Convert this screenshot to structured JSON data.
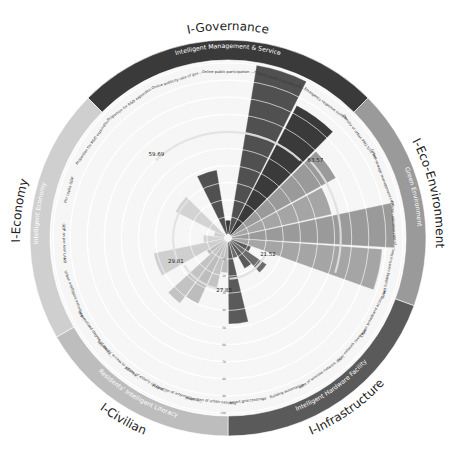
{
  "chart_data": {
    "type": "polar-bar",
    "title": "",
    "radial_axis": {
      "min": 0,
      "max": 100,
      "ticks": [
        0,
        10,
        20,
        30,
        40,
        50,
        60,
        70,
        80,
        90,
        100
      ],
      "grid": true
    },
    "dimensions": [
      {
        "name": "I-Governance",
        "subtitle": "Intelligent Management & Service",
        "color": "#3a3a3a",
        "start_deg": -45,
        "end_deg": 45,
        "average": 59.69,
        "indicators": [
          {
            "label": "Proportion for R&D expenditure of GDP",
            "value": 0
          },
          {
            "label": "Online publicity rate of government non-secret documents",
            "value": 38
          },
          {
            "label": "Online public participation ratio",
            "value": 8
          },
          {
            "label": "Citizen health E-record unification ratio",
            "value": 100
          },
          {
            "label": "Emergency response system",
            "value": 85
          }
        ]
      },
      {
        "name": "I-Eco-Environment",
        "subtitle": "Green Environment",
        "color": "#9a9a9a",
        "start_deg": 45,
        "end_deg": 110,
        "average": 63.57,
        "indicators": [
          {
            "label": "Density of urban PM2.5/10 monitoring points",
            "value": 70
          },
          {
            "label": "Urban sewage management coverage",
            "value": 60
          },
          {
            "label": "Citizen utilization rate of Smart Transportation",
            "value": 95
          },
          {
            "label": "Green building construction rate",
            "value": 88
          }
        ]
      },
      {
        "name": "I-Infrastructure",
        "subtitle": "Intelligent Hardware Facility",
        "color": "#5a5a5a",
        "start_deg": 110,
        "end_deg": 180,
        "average": 21.52,
        "indicators": [
          {
            "label": "Citizen broadband access rate",
            "value": 12
          },
          {
            "label": "Fiber network coverage",
            "value": 25
          },
          {
            "label": "Rate of wireless network coverage",
            "value": 18
          },
          {
            "label": "Building automation",
            "value": 10
          },
          {
            "label": "Smart grid coverage",
            "value": 48
          }
        ]
      },
      {
        "name": "I-Civilian",
        "subtitle": "Residents' Intelligent Literacy",
        "color": "#bdbdbd",
        "start_deg": 180,
        "end_deg": 240,
        "average": 27.85,
        "indicators": [
          {
            "label": "Proportion of urban netizens",
            "value": 18
          },
          {
            "label": "Proportion of information industry employees",
            "value": 28
          },
          {
            "label": "Ability of elderly citizens to use smart devices",
            "value": 40
          },
          {
            "label": "Residents' access to information service",
            "value": 45
          },
          {
            "label": "Informatized degree of education",
            "value": 12
          }
        ]
      },
      {
        "name": "I-Economy",
        "subtitle": "Intelligent Economy",
        "color": "#cfcfcf",
        "start_deg": 240,
        "end_deg": 315,
        "average": 29.81,
        "indicators": [
          {
            "label": "Urban intelligent industry proportion",
            "value": 42
          },
          {
            "label": "GDP on per km² LAND",
            "value": 12
          },
          {
            "label": "Per capita GDP",
            "value": 6
          },
          {
            "label": "Proportion for R&D expenditure of GDP",
            "value": 32
          }
        ]
      }
    ],
    "annotations": [
      "59.69",
      "63.57",
      "21.52",
      "27.85",
      "29.81"
    ],
    "legend": "none"
  },
  "labels": {
    "governance": "I-Governance",
    "eco": "I-Eco-Environment",
    "infra": "I-Infrastructure",
    "civilian": "I-Civilian",
    "economy": "I-Economy"
  }
}
